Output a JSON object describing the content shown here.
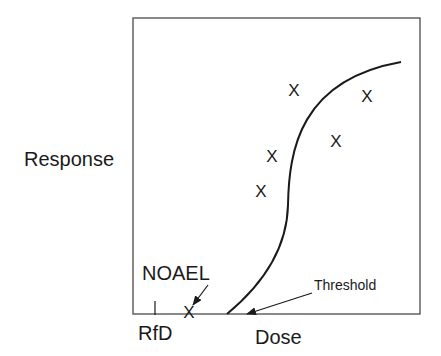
{
  "diagram": {
    "type": "dose-response curve",
    "y_axis_label": "Response",
    "x_axis_label": "Dose",
    "annotations": {
      "noael": "NOAEL",
      "rfd": "RfD",
      "threshold": "Threshold"
    },
    "marker_glyph": "X",
    "markers": [
      {
        "x": 294,
        "y": 90
      },
      {
        "x": 367,
        "y": 96
      },
      {
        "x": 336,
        "y": 141
      },
      {
        "x": 272,
        "y": 156
      },
      {
        "x": 261,
        "y": 191
      },
      {
        "x": 189,
        "y": 312
      }
    ],
    "colors": {
      "line": "#1a1a1a",
      "frame": "#4a4a4a",
      "background": "#ffffff"
    }
  }
}
